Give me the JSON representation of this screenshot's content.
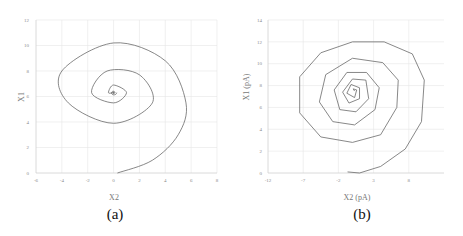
{
  "chart_data": [
    {
      "type": "line",
      "panel_label": "(a)",
      "title": "",
      "xlabel": "X2",
      "ylabel": "X1",
      "xlim": [
        -6,
        8
      ],
      "ylim": [
        0,
        12
      ],
      "xticks": [
        "-6",
        "-4",
        "-2",
        "0",
        "2",
        "4",
        "6",
        "8"
      ],
      "yticks": [
        "0",
        "2",
        "4",
        "6",
        "8",
        "10",
        "12"
      ],
      "grid": true,
      "legend": null,
      "series": [
        {
          "name": "phase trajectory (smooth spiral)",
          "start": [
            0.3,
            0
          ],
          "center": [
            0,
            6.3
          ],
          "approx_points": [
            [
              0.3,
              0
            ],
            [
              3,
              1
            ],
            [
              5,
              3
            ],
            [
              5.6,
              5.5
            ],
            [
              4,
              8.8
            ],
            [
              0,
              10.2
            ],
            [
              -4,
              8
            ],
            [
              -3.5,
              5.5
            ],
            [
              0,
              3.9
            ],
            [
              3,
              5.5
            ],
            [
              2,
              7.7
            ],
            [
              -0.5,
              8
            ],
            [
              -1.7,
              6.3
            ],
            [
              0,
              5.5
            ],
            [
              1,
              6.3
            ],
            [
              0,
              6.9
            ],
            [
              -0.4,
              6.3
            ],
            [
              0,
              6.3
            ]
          ]
        }
      ]
    },
    {
      "type": "line",
      "panel_label": "(b)",
      "title": "",
      "xlabel": "X2 (pA)",
      "ylabel": "X1 (pA)",
      "xlim": [
        -12,
        13
      ],
      "ylim": [
        0,
        14
      ],
      "xticks": [
        "-12",
        "-7",
        "-2",
        "3",
        "8"
      ],
      "yticks": [
        "0",
        "2",
        "4",
        "6",
        "8",
        "10",
        "12",
        "14"
      ],
      "grid": true,
      "legend": null,
      "series": [
        {
          "name": "phase trajectory (polygonal spiral)",
          "start": [
            -0.7,
            0.1
          ],
          "center": [
            0.3,
            7.5
          ],
          "approx_points": [
            [
              -0.7,
              0.1
            ],
            [
              1,
              0
            ],
            [
              4,
              0.6
            ],
            [
              7.5,
              2.2
            ],
            [
              9.8,
              4.7
            ],
            [
              10.2,
              8.5
            ],
            [
              8.5,
              10.9
            ],
            [
              4.5,
              12
            ],
            [
              0,
              12
            ],
            [
              -4.5,
              11
            ],
            [
              -7.5,
              8.8
            ],
            [
              -7.5,
              5.5
            ],
            [
              -4.5,
              3.3
            ],
            [
              0,
              2.8
            ],
            [
              4,
              3.5
            ],
            [
              6.3,
              6
            ],
            [
              6.5,
              8.5
            ],
            [
              4.3,
              10.1
            ],
            [
              0,
              10.5
            ],
            [
              -3.8,
              9
            ],
            [
              -4.7,
              6.5
            ],
            [
              -2.8,
              4.7
            ],
            [
              0.3,
              4.4
            ],
            [
              3.2,
              5.8
            ],
            [
              3.8,
              7.8
            ],
            [
              2,
              9.2
            ],
            [
              -0.8,
              9.2
            ],
            [
              -2.6,
              7.6
            ],
            [
              -1.8,
              5.8
            ],
            [
              0.5,
              5.6
            ],
            [
              2.3,
              6.8
            ],
            [
              1.9,
              8.5
            ],
            [
              0,
              8.6
            ],
            [
              -1.4,
              7.4
            ],
            [
              -0.5,
              6.4
            ],
            [
              1,
              6.8
            ],
            [
              1,
              7.8
            ],
            [
              -0.2,
              8.1
            ],
            [
              -0.8,
              7.3
            ],
            [
              0.3,
              6.9
            ],
            [
              0.6,
              7.6
            ],
            [
              0.1,
              7.7
            ],
            [
              0.3,
              7.5
            ]
          ]
        }
      ]
    }
  ]
}
